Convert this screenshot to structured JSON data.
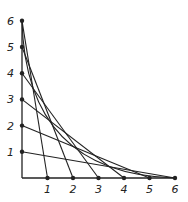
{
  "diagram": {
    "title": "",
    "origin_px": [
      22,
      178
    ],
    "unit_px_x": 25.5,
    "unit_px_y": 26.2,
    "y_axis_labels": [
      "1",
      "2",
      "3",
      "4",
      "5",
      "6"
    ],
    "x_axis_labels": [
      "1",
      "2",
      "3",
      "4",
      "5",
      "6"
    ],
    "lines": [
      {
        "from_y": 6,
        "to_x": 1
      },
      {
        "from_y": 5,
        "to_x": 2
      },
      {
        "from_y": 4,
        "to_x": 3
      },
      {
        "from_y": 3,
        "to_x": 4
      },
      {
        "from_y": 2,
        "to_x": 5
      },
      {
        "from_y": 1,
        "to_x": 6
      }
    ],
    "envelope_curve": {
      "from": "y6",
      "to": "x6"
    },
    "stroke_color": "#222222"
  }
}
